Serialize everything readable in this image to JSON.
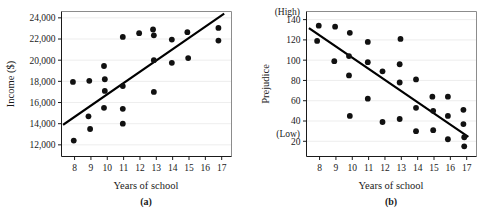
{
  "figure": {
    "background_color": "#ffffff",
    "point_color": "#111111",
    "line_color": "#000000",
    "frame_color": "#8c8c8c"
  },
  "chart_data": [
    {
      "type": "scatter",
      "panel_label": "(a)",
      "title": "",
      "xlabel": "Years of school",
      "ylabel": "Income ($)",
      "xlim": [
        7.2,
        17.6
      ],
      "ylim": [
        10900,
        24600
      ],
      "xticks": [
        8,
        9,
        10,
        11,
        12,
        13,
        14,
        15,
        16,
        17
      ],
      "xticklabels": [
        "8",
        "9",
        "10",
        "11",
        "12",
        "13",
        "14",
        "15",
        "16",
        "17"
      ],
      "yticks": [
        12000,
        14000,
        16000,
        18000,
        20000,
        22000,
        24000
      ],
      "yticklabels": [
        "12,000",
        "14,000",
        "16,000",
        "18,000",
        "20,000",
        "22,000",
        "24,000"
      ],
      "y_low_label": "",
      "y_high_label": "",
      "grid": true,
      "legend": "none",
      "points": [
        {
          "x": 7.95,
          "y": 12400
        },
        {
          "x": 7.9,
          "y": 17950
        },
        {
          "x": 8.85,
          "y": 14700
        },
        {
          "x": 8.95,
          "y": 13500
        },
        {
          "x": 8.9,
          "y": 18050
        },
        {
          "x": 9.8,
          "y": 19450
        },
        {
          "x": 9.85,
          "y": 18200
        },
        {
          "x": 9.85,
          "y": 17100
        },
        {
          "x": 9.8,
          "y": 15500
        },
        {
          "x": 10.95,
          "y": 22200
        },
        {
          "x": 10.95,
          "y": 17550
        },
        {
          "x": 10.95,
          "y": 15400
        },
        {
          "x": 10.95,
          "y": 14000
        },
        {
          "x": 11.95,
          "y": 22550
        },
        {
          "x": 12.8,
          "y": 22900
        },
        {
          "x": 12.85,
          "y": 22350
        },
        {
          "x": 12.85,
          "y": 20000
        },
        {
          "x": 12.85,
          "y": 17000
        },
        {
          "x": 13.95,
          "y": 21950
        },
        {
          "x": 13.95,
          "y": 19750
        },
        {
          "x": 14.9,
          "y": 22650
        },
        {
          "x": 14.95,
          "y": 20200
        },
        {
          "x": 16.8,
          "y": 23050
        },
        {
          "x": 16.8,
          "y": 21850
        }
      ],
      "trend_line": {
        "x1": 7.35,
        "y1": 13950,
        "x2": 17.1,
        "y2": 24350
      }
    },
    {
      "type": "scatter",
      "panel_label": "(b)",
      "title": "",
      "xlabel": "Years of school",
      "ylabel": "Prejudice",
      "xlim": [
        7.2,
        17.6
      ],
      "ylim": [
        5,
        148
      ],
      "xticks": [
        8,
        9,
        10,
        11,
        12,
        13,
        14,
        15,
        16,
        17
      ],
      "xticklabels": [
        "8",
        "9",
        "10",
        "11",
        "12",
        "13",
        "14",
        "15",
        "16",
        "17"
      ],
      "yticks": [
        20,
        40,
        60,
        80,
        100,
        120,
        140
      ],
      "yticklabels": [
        "20",
        "40",
        "60",
        "80",
        "100",
        "120",
        "140"
      ],
      "y_low_label": "(Low)",
      "y_high_label": "(High)",
      "grid": true,
      "legend": "none",
      "points": [
        {
          "x": 7.95,
          "y": 134
        },
        {
          "x": 7.85,
          "y": 119
        },
        {
          "x": 8.95,
          "y": 133
        },
        {
          "x": 8.9,
          "y": 99
        },
        {
          "x": 9.85,
          "y": 127
        },
        {
          "x": 9.8,
          "y": 104
        },
        {
          "x": 9.8,
          "y": 85
        },
        {
          "x": 9.85,
          "y": 45
        },
        {
          "x": 10.95,
          "y": 118
        },
        {
          "x": 10.95,
          "y": 98
        },
        {
          "x": 10.95,
          "y": 62
        },
        {
          "x": 11.85,
          "y": 89
        },
        {
          "x": 11.85,
          "y": 39
        },
        {
          "x": 12.95,
          "y": 121
        },
        {
          "x": 12.9,
          "y": 96
        },
        {
          "x": 12.9,
          "y": 78
        },
        {
          "x": 12.9,
          "y": 42
        },
        {
          "x": 13.9,
          "y": 81
        },
        {
          "x": 13.9,
          "y": 53
        },
        {
          "x": 13.9,
          "y": 30
        },
        {
          "x": 14.9,
          "y": 64
        },
        {
          "x": 14.95,
          "y": 50
        },
        {
          "x": 14.95,
          "y": 31
        },
        {
          "x": 15.85,
          "y": 64
        },
        {
          "x": 15.85,
          "y": 45
        },
        {
          "x": 15.85,
          "y": 22
        },
        {
          "x": 16.8,
          "y": 51
        },
        {
          "x": 16.8,
          "y": 37
        },
        {
          "x": 16.85,
          "y": 24
        },
        {
          "x": 16.85,
          "y": 15
        }
      ],
      "trend_line": {
        "x1": 7.4,
        "y1": 131,
        "x2": 17.05,
        "y2": 25
      }
    }
  ]
}
